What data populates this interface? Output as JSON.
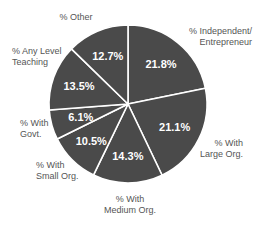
{
  "chart_data": {
    "type": "pie",
    "title": "",
    "start_angle_deg": 0,
    "direction": "clockwise",
    "slice_color": "#4a4a4a",
    "separator_color": "#ffffff",
    "value_label_color": "#ffffff",
    "slices": [
      {
        "label": "% Independent/ Entrepreneur",
        "value": 21.8,
        "display": "21.8%"
      },
      {
        "label": "% With Large Org.",
        "value": 21.1,
        "display": "21.1%"
      },
      {
        "label": "% With Medium Org.",
        "value": 14.3,
        "display": "14.3%"
      },
      {
        "label": "% With Small Org.",
        "value": 10.5,
        "display": "10.5%"
      },
      {
        "label": "% With Govt.",
        "value": 6.1,
        "display": "6.1%"
      },
      {
        "label": "% Any Level Teaching",
        "value": 13.5,
        "display": "13.5%"
      },
      {
        "label": "% Other",
        "value": 12.7,
        "display": "12.7%"
      }
    ]
  },
  "labels": {
    "independent_l1": "% Independent/",
    "independent_l2": "Entrepreneur",
    "large_l1": "% With",
    "large_l2": "Large Org.",
    "medium_l1": "% With",
    "medium_l2": "Medium Org.",
    "small_l1": "% With",
    "small_l2": "Small Org.",
    "govt_l1": "% With",
    "govt_l2": "Govt.",
    "teaching_l1": "% Any Level",
    "teaching_l2": "Teaching",
    "other": "% Other"
  }
}
